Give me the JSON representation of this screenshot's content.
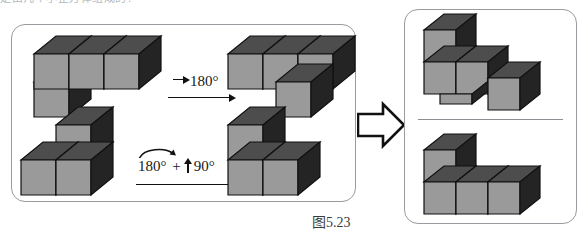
{
  "page": {
    "top_clipped_text": "是由几个小正方体组成的？",
    "caption": "图5.23"
  },
  "left_panel": {
    "name": "transformation-panel",
    "rows": [
      {
        "id": "row-1",
        "source_shape": "L-shaped stack: row of three cubes with one cube below the leftmost",
        "operation_label": "180°",
        "operation_prefix_icon": "right-arrow-icon",
        "result_shape": "row of three cubes with one cube in front of the rightmost"
      },
      {
        "id": "row-2",
        "source_shape": "two cubes side by side with one cube stacked on the right one",
        "operation_label": "180°  +  90°",
        "operation_rotate_icon": "curved-rotation-arrow-icon",
        "operation_up_icon": "up-arrow-icon",
        "result_shape": "two cubes tall on the left with one cube to the right at the bottom"
      }
    ]
  },
  "transition": {
    "icon": "block-right-arrow-icon"
  },
  "right_panel": {
    "name": "result-panel",
    "items": [
      {
        "id": "result-top",
        "shape": "staircase of three cube groups descending to the right"
      },
      {
        "id": "result-bottom",
        "shape": "two cubes tall on the left with two cubes to the right at the bottom"
      }
    ],
    "has_divider": true
  },
  "colors": {
    "cube_top": "#4d4d4d",
    "cube_front": "#9a9a9a",
    "cube_side": "#242424",
    "cube_outline": "#111111",
    "panel_border": "#9a9aa0",
    "background": "#ffffff",
    "caption_text": "#3b3b3b"
  }
}
